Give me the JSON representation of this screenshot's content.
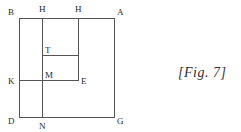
{
  "figure": {
    "caption": "[Fig. 7]",
    "line_color": "#555555",
    "labels": {
      "B": "B",
      "H1": "H",
      "H2": "H",
      "A": "A",
      "T": "T",
      "K": "K",
      "M": "M",
      "E": "E",
      "D": "D",
      "N": "N",
      "G": "G"
    }
  }
}
